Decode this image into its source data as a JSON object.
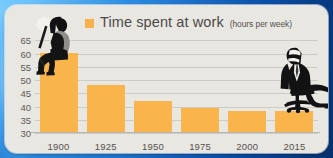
{
  "legend": {
    "swatch_color": "#f7b14a",
    "title": "Time spent at work",
    "unit": "(hours per week)"
  },
  "figures": {
    "left": "industrial-worker-with-shovel-silhouette",
    "right": "office-worker-in-chair-silhouette"
  },
  "colors": {
    "bar": "#fab44c",
    "card_background": "#e9e7e2",
    "gridline": "#cdcbc6",
    "text": "#55524e",
    "page_background": "#0b4ea8"
  },
  "chart_data": {
    "type": "bar",
    "title": "Time spent at work",
    "subtitle": "(hours per week)",
    "xlabel": "",
    "ylabel": "",
    "categories": [
      "1900",
      "1925",
      "1950",
      "1975",
      "2000",
      "2015"
    ],
    "values": [
      60,
      48,
      42,
      39,
      38,
      38
    ],
    "ylim": [
      30,
      67
    ],
    "yticks": [
      30,
      35,
      40,
      45,
      50,
      55,
      60,
      65
    ],
    "ytick_labels": [
      "30",
      "35",
      "40",
      "45",
      "50",
      "55",
      "60",
      "65"
    ],
    "grid": true,
    "legend": [
      "Time spent at work"
    ],
    "legend_position": "top",
    "annotations": [
      "industrial worker silhouette seated on the 1900 bar",
      "office worker silhouette seated on the 2015 bar"
    ]
  }
}
